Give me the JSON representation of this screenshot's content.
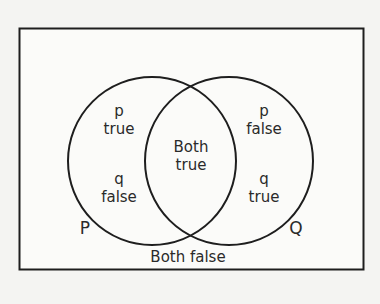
{
  "diagram": {
    "type": "venn",
    "colors": {
      "background": "#f4f4f2",
      "stroke": "#1e1e1e",
      "text": "#2a2a2a"
    },
    "sets": [
      {
        "name": "P",
        "label": "P"
      },
      {
        "name": "Q",
        "label": "Q"
      }
    ],
    "regions": {
      "p_only": {
        "line1": "p",
        "line2": "true",
        "line3": "q",
        "line4": "false"
      },
      "q_only": {
        "line1": "p",
        "line2": "false",
        "line3": "q",
        "line4": "true"
      },
      "intersection": {
        "line1": "Both",
        "line2": "true"
      },
      "outside": {
        "label": "Both false"
      }
    }
  }
}
